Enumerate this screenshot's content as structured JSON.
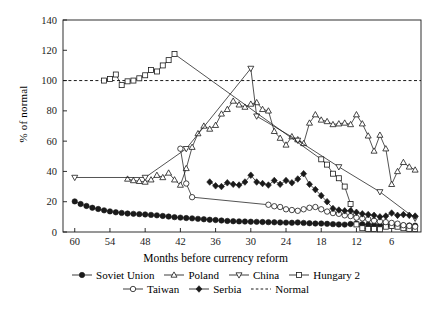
{
  "chart_data": {
    "type": "line",
    "title": "",
    "xlabel": "Months before currency reform",
    "ylabel": "% of normal",
    "xlim": [
      62,
      1
    ],
    "ylim": [
      0,
      140
    ],
    "x_ticks": [
      60,
      54,
      48,
      42,
      36,
      30,
      24,
      18,
      12,
      6
    ],
    "y_ticks": [
      0,
      20,
      40,
      60,
      80,
      100,
      120,
      140
    ],
    "x_reversed": true,
    "grid": false,
    "legend_position": "below",
    "reference_line": {
      "label": "Normal",
      "value": 100,
      "style": "dashed"
    },
    "series": [
      {
        "name": "Soviet Union",
        "marker": "filled-circle",
        "x": [
          60,
          59,
          58,
          57,
          56,
          55,
          54,
          53,
          52,
          51,
          50,
          49,
          48,
          47,
          46,
          45,
          44,
          43,
          42,
          41,
          40,
          39,
          38,
          37,
          36,
          35,
          34,
          33,
          32,
          31,
          30,
          29,
          28,
          27,
          26,
          25,
          24,
          23,
          22,
          21,
          20,
          19,
          18,
          17,
          16,
          15,
          14,
          13,
          12,
          11,
          10,
          9,
          8,
          7,
          6,
          5,
          4,
          3,
          2
        ],
        "y": [
          20.2,
          18.5,
          17.2,
          16.0,
          15.2,
          14.3,
          13.6,
          13.0,
          12.6,
          12.2,
          12.0,
          11.8,
          11.6,
          11.3,
          11.0,
          10.6,
          10.2,
          9.8,
          9.5,
          9.2,
          9.0,
          8.7,
          8.4,
          8.1,
          7.9,
          7.6,
          7.3,
          7.1,
          7.0,
          6.9,
          6.8,
          6.7,
          6.6,
          6.5,
          6.4,
          6.3,
          6.2,
          6.1,
          6.3,
          6.0,
          5.8,
          5.6,
          5.6,
          5.4,
          5.2,
          5.0,
          4.9,
          5.3,
          5.5,
          5.1,
          4.8,
          4.6,
          4.5,
          4.5,
          4.4,
          4.4,
          4.3,
          4.3,
          4.2
        ]
      },
      {
        "name": "Poland",
        "marker": "open-triangle-up",
        "x": [
          51,
          50,
          49,
          48,
          47,
          46,
          45,
          44,
          43,
          42,
          41,
          40,
          39,
          38,
          37,
          36,
          35,
          34,
          33,
          32,
          31,
          30,
          29,
          28,
          27,
          26,
          25,
          24,
          23,
          22,
          21,
          20,
          19,
          18,
          17,
          16,
          15,
          14,
          13,
          12,
          11,
          10,
          9,
          8,
          7,
          6,
          5,
          4,
          3,
          2
        ],
        "y": [
          35.0,
          34.0,
          33.5,
          33.0,
          34.5,
          37.5,
          36.0,
          39.0,
          34.5,
          31.0,
          42.0,
          56.0,
          65.0,
          70.0,
          68.0,
          70.5,
          78.0,
          81.0,
          86.5,
          84.0,
          82.5,
          84.5,
          85.5,
          81.0,
          80.0,
          66.5,
          62.0,
          57.5,
          63.0,
          61.0,
          58.5,
          72.0,
          77.5,
          74.0,
          73.0,
          71.0,
          71.5,
          72.0,
          71.0,
          77.5,
          71.5,
          63.5,
          53.5,
          64.0,
          55.0,
          31.5,
          40.0,
          46.0,
          43.0,
          41.0
        ]
      },
      {
        "name": "China",
        "marker": "open-triangle-down",
        "x": [
          60,
          48,
          41,
          30,
          29,
          22,
          15,
          8,
          2
        ],
        "y": [
          36.0,
          36.0,
          55.0,
          108.0,
          76.5,
          60.5,
          43.0,
          26.5,
          9.0
        ]
      },
      {
        "name": "Hungary 2",
        "marker": "open-square",
        "x": [
          55,
          54,
          53,
          52,
          51,
          50,
          49,
          48,
          47,
          46,
          45,
          44,
          43,
          18,
          17,
          16,
          15,
          14,
          13,
          12,
          11,
          10,
          9,
          8,
          7,
          6,
          5,
          4,
          3,
          2
        ],
        "y": [
          100.0,
          101.0,
          104.0,
          97.0,
          99.5,
          100.0,
          101.5,
          103.5,
          107.0,
          106.0,
          110.0,
          113.5,
          117.5,
          48.0,
          44.5,
          38.5,
          35.5,
          30.0,
          18.5,
          5.0,
          2.5,
          2.0,
          2.0,
          1.8,
          3.5,
          4.0,
          3.5,
          2.5,
          2.0,
          2.0
        ]
      },
      {
        "name": "Taiwan",
        "marker": "open-circle",
        "x": [
          42,
          41,
          40,
          27,
          26,
          25,
          24,
          23,
          22,
          21,
          20,
          19,
          18,
          17,
          16,
          15,
          14,
          13,
          12,
          11,
          10,
          9,
          8,
          7,
          6,
          5,
          4,
          3,
          2
        ],
        "y": [
          55.0,
          32.0,
          23.0,
          18.0,
          17.0,
          16.5,
          15.0,
          14.5,
          14.0,
          15.0,
          16.0,
          16.5,
          15.0,
          13.5,
          12.5,
          12.0,
          11.0,
          10.5,
          9.5,
          9.0,
          8.5,
          7.5,
          7.0,
          6.5,
          6.0,
          5.5,
          4.5,
          4.0,
          3.5
        ]
      },
      {
        "name": "Serbia",
        "marker": "filled-diamond",
        "x": [
          37,
          36,
          35,
          34,
          33,
          32,
          31,
          30,
          29,
          28,
          27,
          26,
          25,
          24,
          23,
          22,
          21,
          20,
          19,
          18,
          17,
          16,
          15,
          14,
          13,
          12,
          11,
          10,
          9,
          8,
          7,
          6,
          5,
          4,
          3,
          2
        ],
        "y": [
          33.0,
          30.5,
          30.0,
          32.5,
          31.5,
          31.0,
          33.0,
          37.5,
          33.0,
          32.0,
          31.0,
          34.0,
          31.5,
          34.0,
          32.5,
          35.0,
          38.5,
          31.5,
          28.0,
          24.0,
          20.0,
          15.5,
          14.5,
          14.0,
          14.0,
          13.0,
          12.0,
          11.5,
          11.0,
          10.0,
          10.5,
          12.5,
          11.0,
          11.5,
          11.0,
          10.5
        ]
      }
    ]
  },
  "axes": {
    "y_label": "% of normal",
    "x_label": "Months before currency reform",
    "y_tick_labels": [
      "0",
      "20",
      "40",
      "60",
      "80",
      "100",
      "120",
      "140"
    ],
    "x_tick_labels": [
      "60",
      "54",
      "48",
      "42",
      "36",
      "30",
      "24",
      "18",
      "12",
      "6"
    ]
  },
  "legend": {
    "row1": [
      {
        "label": "Soviet Union",
        "marker": "filled-circle"
      },
      {
        "label": "Poland",
        "marker": "open-triangle-up"
      },
      {
        "label": "China",
        "marker": "open-triangle-down"
      },
      {
        "label": "Hungary 2",
        "marker": "open-square"
      }
    ],
    "row2": [
      {
        "label": "Taiwan",
        "marker": "open-circle"
      },
      {
        "label": "Serbia",
        "marker": "filled-diamond"
      },
      {
        "label": "Normal",
        "marker": "dashed-line"
      }
    ]
  },
  "colors": {
    "ink": "#1a1a1a",
    "background": "#ffffff"
  }
}
